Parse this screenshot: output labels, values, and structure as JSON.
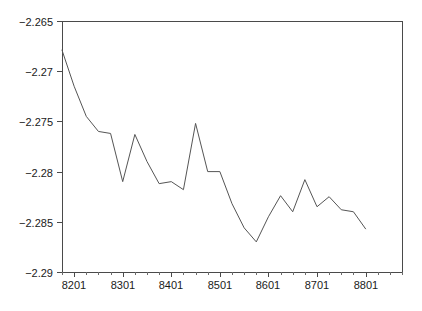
{
  "chart_data": {
    "type": "line",
    "title": "",
    "subtitle": "",
    "xlabel": "",
    "ylabel": "",
    "xlim": [
      8104,
      8804
    ],
    "ylim": [
      -2.29,
      -2.265
    ],
    "grid": false,
    "legend": null,
    "y_ticks": [
      "-2.265",
      "-2.27",
      "-2.275",
      "-2.28",
      "-2.285",
      "-2.29"
    ],
    "y_tick_values": [
      -2.265,
      -2.27,
      -2.275,
      -2.28,
      -2.285,
      -2.29
    ],
    "x_ticks": [
      "8201",
      "8301",
      "8401",
      "8501",
      "8601",
      "8701",
      "8801"
    ],
    "x_tick_values": [
      8201,
      8301,
      8401,
      8501,
      8601,
      8701,
      8801
    ],
    "x_minor_interval": 1,
    "series": [
      {
        "name": "series-1",
        "color": "#555555",
        "x": [
          8104,
          8201,
          8202,
          8203,
          8204,
          8301,
          8302,
          8303,
          8304,
          8401,
          8402,
          8403,
          8404,
          8501,
          8502,
          8503,
          8504,
          8601,
          8602,
          8603,
          8604,
          8701,
          8702,
          8703,
          8704,
          8801
        ],
        "values": [
          -2.2679,
          -2.2715,
          -2.2745,
          -2.276,
          -2.2762,
          -2.281,
          -2.2763,
          -2.279,
          -2.2812,
          -2.281,
          -2.2818,
          -2.2752,
          -2.28,
          -2.28,
          -2.2832,
          -2.2856,
          -2.287,
          -2.2845,
          -2.2824,
          -2.284,
          -2.2808,
          -2.2835,
          -2.2825,
          -2.2838,
          -2.284,
          -2.2857
        ]
      }
    ]
  },
  "axes_geometry": {
    "left": 62,
    "right": 402,
    "top": 21,
    "bottom": 272
  }
}
